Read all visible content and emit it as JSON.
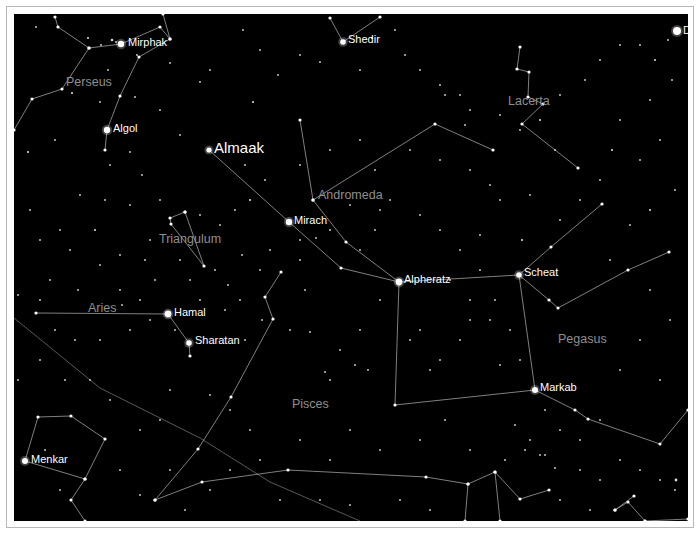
{
  "view": {
    "frame_color": "#b8b8b8",
    "sky_color": "#000000",
    "line_color": "#bdbdbd",
    "star_label_color": "#ffffff",
    "constellation_label_color": "#8f8f8f"
  },
  "constellations": [
    {
      "name": "Perseus",
      "x": 66,
      "y": 86
    },
    {
      "name": "Lacerta",
      "x": 508,
      "y": 105
    },
    {
      "name": "Andromeda",
      "x": 318,
      "y": 199
    },
    {
      "name": "Triangulum",
      "x": 159,
      "y": 243
    },
    {
      "name": "Aries",
      "x": 88,
      "y": 312
    },
    {
      "name": "Pegasus",
      "x": 558,
      "y": 343
    },
    {
      "name": "Pisces",
      "x": 292,
      "y": 408
    }
  ],
  "named_stars": [
    {
      "name": "Mirphak",
      "x": 121,
      "y": 44,
      "r": 3.2,
      "lx": 128,
      "ly": 42,
      "big": false
    },
    {
      "name": "Algol",
      "x": 107,
      "y": 130,
      "r": 3.2,
      "lx": 113,
      "ly": 128,
      "big": false
    },
    {
      "name": "Almaak",
      "x": 209,
      "y": 150,
      "r": 2.6,
      "lx": 214,
      "ly": 148,
      "big": true
    },
    {
      "name": "Shedir",
      "x": 343,
      "y": 42,
      "r": 2.8,
      "lx": 348,
      "ly": 39,
      "big": false
    },
    {
      "name": "Mirach",
      "x": 289,
      "y": 222,
      "r": 3.2,
      "lx": 294,
      "ly": 220,
      "big": false
    },
    {
      "name": "Alpheratz",
      "x": 399,
      "y": 282,
      "r": 3.4,
      "lx": 404,
      "ly": 279,
      "big": false
    },
    {
      "name": "Scheat",
      "x": 519,
      "y": 275,
      "r": 2.8,
      "lx": 524,
      "ly": 272,
      "big": false
    },
    {
      "name": "Markab",
      "x": 535,
      "y": 390,
      "r": 3.0,
      "lx": 540,
      "ly": 387,
      "big": false
    },
    {
      "name": "Hamal",
      "x": 168,
      "y": 314,
      "r": 3.4,
      "lx": 174,
      "ly": 312,
      "big": false
    },
    {
      "name": "Sharatan",
      "x": 189,
      "y": 343,
      "r": 2.8,
      "lx": 195,
      "ly": 340,
      "big": false
    },
    {
      "name": "Menkar",
      "x": 25,
      "y": 461,
      "r": 3.0,
      "lx": 31,
      "ly": 459,
      "big": false
    },
    {
      "name": "D",
      "x": 677,
      "y": 31,
      "r": 4.0,
      "lx": 683,
      "ly": 30,
      "big": false
    }
  ],
  "constellation_lines": [
    [
      [
        55,
        17
      ],
      [
        58,
        27
      ],
      [
        89,
        48
      ],
      [
        121,
        44
      ],
      [
        160,
        27
      ],
      [
        170,
        39
      ],
      [
        163,
        14
      ]
    ],
    [
      [
        89,
        48
      ],
      [
        62,
        89
      ],
      [
        32,
        99
      ],
      [
        14,
        130
      ]
    ],
    [
      [
        170,
        39
      ],
      [
        139,
        57
      ],
      [
        120,
        96
      ],
      [
        107,
        130
      ],
      [
        105,
        150
      ]
    ],
    [
      [
        380,
        17
      ],
      [
        343,
        42
      ]
    ],
    [
      [
        343,
        42
      ],
      [
        330,
        18
      ]
    ],
    [
      [
        209,
        150
      ],
      [
        289,
        222
      ],
      [
        341,
        268
      ],
      [
        399,
        282
      ]
    ],
    [
      [
        300,
        120
      ],
      [
        313,
        200
      ],
      [
        346,
        242
      ],
      [
        399,
        282
      ]
    ],
    [
      [
        313,
        200
      ],
      [
        435,
        124
      ],
      [
        493,
        150
      ]
    ],
    [
      [
        399,
        282
      ],
      [
        519,
        275
      ],
      [
        535,
        390
      ],
      [
        395,
        405
      ],
      [
        399,
        282
      ]
    ],
    [
      [
        519,
        275
      ],
      [
        551,
        247
      ],
      [
        602,
        204
      ]
    ],
    [
      [
        519,
        275
      ],
      [
        549,
        300
      ],
      [
        558,
        308
      ],
      [
        628,
        270
      ],
      [
        669,
        252
      ]
    ],
    [
      [
        535,
        390
      ],
      [
        575,
        410
      ],
      [
        588,
        419
      ],
      [
        660,
        444
      ],
      [
        688,
        410
      ]
    ],
    [
      [
        168,
        314
      ],
      [
        36,
        313
      ]
    ],
    [
      [
        168,
        314
      ],
      [
        189,
        343
      ],
      [
        190,
        356
      ]
    ],
    [
      [
        185,
        212
      ],
      [
        170,
        218
      ],
      [
        171,
        224
      ],
      [
        204,
        266
      ],
      [
        185,
        212
      ]
    ],
    [
      [
        520,
        47
      ],
      [
        517,
        69
      ],
      [
        529,
        72
      ],
      [
        528,
        97
      ],
      [
        543,
        104
      ],
      [
        522,
        124
      ],
      [
        578,
        168
      ]
    ],
    [
      [
        25,
        461
      ],
      [
        38,
        417
      ],
      [
        71,
        416
      ],
      [
        105,
        439
      ],
      [
        85,
        479
      ],
      [
        25,
        461
      ]
    ],
    [
      [
        85,
        479
      ],
      [
        71,
        500
      ],
      [
        85,
        521
      ]
    ],
    [
      [
        155,
        500
      ],
      [
        198,
        449
      ],
      [
        231,
        397
      ],
      [
        273,
        319
      ],
      [
        265,
        297
      ],
      [
        281,
        272
      ]
    ],
    [
      [
        155,
        500
      ],
      [
        202,
        482
      ],
      [
        288,
        470
      ],
      [
        426,
        477
      ],
      [
        468,
        484
      ],
      [
        495,
        472
      ],
      [
        520,
        499
      ],
      [
        549,
        490
      ]
    ],
    [
      [
        468,
        484
      ],
      [
        465,
        521
      ]
    ],
    [
      [
        495,
        472
      ],
      [
        500,
        521
      ]
    ],
    [
      [
        615,
        510
      ],
      [
        628,
        502
      ],
      [
        645,
        521
      ]
    ],
    [
      [
        615,
        510
      ],
      [
        634,
        496
      ]
    ],
    [
      [
        688,
        519
      ],
      [
        645,
        521
      ]
    ]
  ],
  "ecliptic": [
    [
      14,
      318
    ],
    [
      100,
      388
    ],
    [
      200,
      438
    ],
    [
      270,
      482
    ],
    [
      360,
      521
    ]
  ],
  "stars": [
    [
      36,
      27,
      1
    ],
    [
      88,
      38,
      1.2
    ],
    [
      101,
      45,
      1
    ],
    [
      112,
      40,
      1.4
    ],
    [
      116,
      42,
      1
    ],
    [
      137,
      55,
      1
    ],
    [
      108,
      70,
      1
    ],
    [
      170,
      63,
      1
    ],
    [
      200,
      82,
      1
    ],
    [
      210,
      70,
      1
    ],
    [
      72,
      93,
      1.2
    ],
    [
      100,
      102,
      1
    ],
    [
      135,
      97,
      1
    ],
    [
      160,
      110,
      1
    ],
    [
      28,
      152,
      1.2
    ],
    [
      130,
      152,
      1
    ],
    [
      142,
      175,
      1
    ],
    [
      110,
      165,
      1
    ],
    [
      55,
      140,
      1
    ],
    [
      180,
      135,
      1
    ],
    [
      243,
      30,
      1
    ],
    [
      260,
      50,
      1
    ],
    [
      253,
      102,
      1.2
    ],
    [
      278,
      75,
      1
    ],
    [
      300,
      55,
      1
    ],
    [
      320,
      62,
      1
    ],
    [
      360,
      70,
      1
    ],
    [
      372,
      38,
      1.2
    ],
    [
      395,
      30,
      1
    ],
    [
      405,
      55,
      1
    ],
    [
      420,
      70,
      1
    ],
    [
      440,
      85,
      1
    ],
    [
      460,
      95,
      1
    ],
    [
      470,
      110,
      1
    ],
    [
      445,
      95,
      1
    ],
    [
      465,
      125,
      1
    ],
    [
      500,
      115,
      1
    ],
    [
      520,
      130,
      1
    ],
    [
      540,
      120,
      1.2
    ],
    [
      555,
      150,
      1
    ],
    [
      560,
      95,
      1
    ],
    [
      585,
      80,
      1
    ],
    [
      600,
      60,
      1
    ],
    [
      620,
      45,
      1
    ],
    [
      640,
      45,
      1
    ],
    [
      655,
      60,
      1.2
    ],
    [
      668,
      40,
      1
    ],
    [
      672,
      80,
      1
    ],
    [
      650,
      100,
      1
    ],
    [
      620,
      120,
      1
    ],
    [
      612,
      150,
      1.2
    ],
    [
      640,
      160,
      1
    ],
    [
      660,
      140,
      1
    ],
    [
      675,
      190,
      1
    ],
    [
      650,
      210,
      1.2
    ],
    [
      630,
      225,
      1
    ],
    [
      610,
      260,
      1
    ],
    [
      650,
      290,
      1
    ],
    [
      670,
      320,
      1
    ],
    [
      640,
      340,
      1
    ],
    [
      620,
      370,
      1
    ],
    [
      660,
      380,
      1
    ],
    [
      600,
      420,
      1
    ],
    [
      580,
      440,
      1
    ],
    [
      540,
      455,
      1
    ],
    [
      505,
      460,
      1
    ],
    [
      470,
      450,
      1
    ],
    [
      445,
      420,
      1
    ],
    [
      420,
      440,
      1
    ],
    [
      380,
      450,
      1
    ],
    [
      350,
      430,
      1
    ],
    [
      330,
      460,
      1
    ],
    [
      300,
      440,
      1
    ],
    [
      280,
      500,
      1
    ],
    [
      320,
      500,
      1
    ],
    [
      350,
      505,
      1
    ],
    [
      400,
      500,
      1
    ],
    [
      430,
      510,
      1
    ],
    [
      560,
      500,
      1
    ],
    [
      590,
      510,
      1
    ],
    [
      250,
      200,
      1.2
    ],
    [
      265,
      180,
      1
    ],
    [
      245,
      165,
      1
    ],
    [
      300,
      165,
      1
    ],
    [
      330,
      150,
      1
    ],
    [
      360,
      140,
      1
    ],
    [
      375,
      170,
      1
    ],
    [
      390,
      200,
      1
    ],
    [
      420,
      215,
      1
    ],
    [
      440,
      230,
      1
    ],
    [
      460,
      250,
      1
    ],
    [
      480,
      235,
      1
    ],
    [
      450,
      280,
      1
    ],
    [
      470,
      300,
      1
    ],
    [
      490,
      320,
      1
    ],
    [
      495,
      300,
      1
    ],
    [
      510,
      330,
      1
    ],
    [
      460,
      340,
      1
    ],
    [
      440,
      360,
      1
    ],
    [
      420,
      330,
      1
    ],
    [
      380,
      300,
      1
    ],
    [
      360,
      330,
      1
    ],
    [
      340,
      350,
      1
    ],
    [
      330,
      380,
      1
    ],
    [
      355,
      365,
      1
    ],
    [
      368,
      370,
      1
    ],
    [
      325,
      372,
      1
    ],
    [
      310,
      332,
      1
    ],
    [
      290,
      330,
      1
    ],
    [
      305,
      290,
      1
    ],
    [
      240,
      300,
      1
    ],
    [
      228,
      285,
      1
    ],
    [
      215,
      270,
      1
    ],
    [
      242,
      255,
      1
    ],
    [
      225,
      310,
      1
    ],
    [
      245,
      340,
      1
    ],
    [
      262,
      320,
      1
    ],
    [
      200,
      300,
      1
    ],
    [
      155,
      280,
      1
    ],
    [
      145,
      260,
      1
    ],
    [
      120,
      255,
      1
    ],
    [
      95,
      230,
      1.2
    ],
    [
      105,
      200,
      1
    ],
    [
      80,
      195,
      1
    ],
    [
      60,
      230,
      1
    ],
    [
      40,
      240,
      1
    ],
    [
      30,
      210,
      1
    ],
    [
      50,
      280,
      1
    ],
    [
      100,
      265,
      1
    ],
    [
      78,
      290,
      1
    ],
    [
      150,
      320,
      1
    ],
    [
      130,
      330,
      1
    ],
    [
      100,
      340,
      1
    ],
    [
      75,
      340,
      1
    ],
    [
      55,
      330,
      1
    ],
    [
      40,
      360,
      1
    ],
    [
      65,
      380,
      1
    ],
    [
      90,
      380,
      1
    ],
    [
      110,
      400,
      1
    ],
    [
      140,
      430,
      1
    ],
    [
      160,
      420,
      1
    ],
    [
      170,
      390,
      1
    ],
    [
      210,
      395,
      1
    ],
    [
      230,
      410,
      1
    ],
    [
      250,
      430,
      1
    ],
    [
      260,
      460,
      1
    ],
    [
      45,
      450,
      1
    ],
    [
      60,
      490,
      1
    ],
    [
      120,
      470,
      1
    ],
    [
      140,
      495,
      1
    ],
    [
      185,
      510,
      1
    ],
    [
      210,
      490,
      1
    ],
    [
      230,
      470,
      1
    ],
    [
      170,
      470,
      1
    ],
    [
      18,
      295,
      1
    ],
    [
      18,
      380,
      1
    ],
    [
      40,
      300,
      1
    ],
    [
      122,
      305,
      1
    ],
    [
      140,
      300,
      1
    ],
    [
      175,
      330,
      1
    ],
    [
      300,
      240,
      1
    ],
    [
      316,
      238,
      1
    ],
    [
      330,
      230,
      1
    ],
    [
      360,
      250,
      1
    ],
    [
      375,
      230,
      1
    ],
    [
      380,
      210,
      1
    ],
    [
      350,
      205,
      1
    ],
    [
      300,
      260,
      1
    ],
    [
      270,
      250,
      1
    ],
    [
      260,
      270,
      1
    ],
    [
      220,
      225,
      1
    ],
    [
      235,
      210,
      1
    ],
    [
      200,
      215,
      1
    ],
    [
      160,
      200,
      1
    ],
    [
      130,
      205,
      1
    ],
    [
      150,
      240,
      1
    ],
    [
      180,
      260,
      1
    ],
    [
      190,
      280,
      1
    ],
    [
      120,
      290,
      1
    ],
    [
      70,
      250,
      1
    ],
    [
      522,
      240,
      1.2
    ],
    [
      560,
      220,
      1
    ],
    [
      580,
      200,
      1
    ],
    [
      600,
      180,
      1
    ],
    [
      530,
      195,
      1
    ],
    [
      500,
      200,
      1
    ],
    [
      490,
      185,
      1
    ],
    [
      470,
      170,
      1
    ],
    [
      440,
      160,
      1
    ],
    [
      410,
      150,
      1
    ],
    [
      480,
      270,
      1
    ],
    [
      470,
      320,
      1
    ],
    [
      430,
      370,
      1
    ],
    [
      410,
      340,
      1
    ],
    [
      500,
      365,
      1
    ],
    [
      520,
      360,
      1
    ],
    [
      545,
      410,
      1
    ],
    [
      560,
      430,
      1
    ],
    [
      620,
      460,
      1
    ],
    [
      640,
      470,
      1
    ],
    [
      660,
      480,
      1
    ],
    [
      675,
      490,
      1
    ],
    [
      676,
      480,
      1.6
    ],
    [
      600,
      480,
      1
    ],
    [
      580,
      470,
      1
    ],
    [
      555,
      468,
      1
    ],
    [
      545,
      455,
      1
    ],
    [
      530,
      440,
      1
    ],
    [
      525,
      450,
      1
    ],
    [
      515,
      425,
      1
    ]
  ]
}
